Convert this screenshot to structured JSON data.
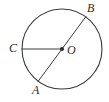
{
  "figure": {
    "kind": "circle-geometry-diagram",
    "background_color": "#ffffff",
    "stroke_color": "#3a3a3a",
    "label_color": "#2b2b2b",
    "width": 109,
    "height": 102,
    "circle": {
      "center_x": 62,
      "center_y": 49,
      "radius": 40,
      "stroke_width": 1.1
    },
    "points": [
      {
        "id": "A",
        "label": "A",
        "x": 38.0,
        "y": 81.5,
        "on_circle": true
      },
      {
        "id": "B",
        "label": "B",
        "x": 86.0,
        "y": 16.5,
        "on_circle": true
      },
      {
        "id": "C",
        "label": "C",
        "x": 22.0,
        "y": 49.0,
        "on_circle": true
      },
      {
        "id": "O",
        "label": "O",
        "x": 62.0,
        "y": 49.0,
        "on_circle": false,
        "is_center": true,
        "marker": "filled-dot"
      }
    ],
    "segments": [
      {
        "id": "AB",
        "from": "A",
        "to": "B",
        "role": "diameter"
      },
      {
        "id": "CO",
        "from": "C",
        "to": "O",
        "role": "radius"
      }
    ],
    "labels": {
      "A": "A",
      "B": "B",
      "C": "C",
      "O": "O"
    }
  }
}
